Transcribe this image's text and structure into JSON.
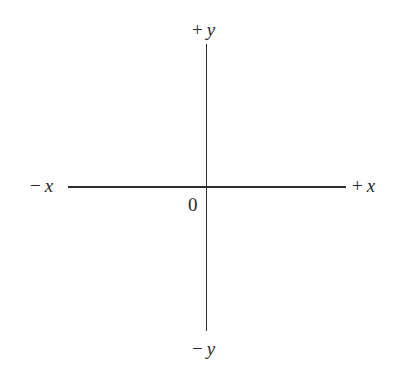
{
  "diagram": {
    "axes": {
      "positive_y": {
        "sign": "+",
        "var": "y"
      },
      "negative_y": {
        "sign": "−",
        "var": "y"
      },
      "negative_x": {
        "sign": "−",
        "var": "x"
      },
      "positive_x": {
        "sign": "+",
        "var": "x"
      }
    },
    "origin_label": "0",
    "line_color": "#2e2e2e",
    "text_color": "#2a2a2a"
  }
}
